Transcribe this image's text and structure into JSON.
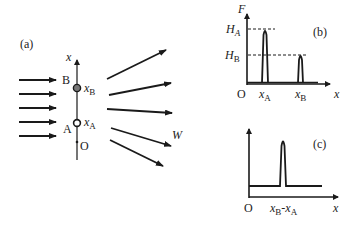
{
  "panel_a": {
    "label": "(a)",
    "axis_label": "x",
    "point_B": {
      "name": "B",
      "coord": "x",
      "sub": "B"
    },
    "point_A": {
      "name": "A",
      "coord": "x",
      "sub": "A"
    },
    "origin": "O",
    "scattered_label": "W",
    "incident_arrow_count": 5,
    "scattered_arrow_count": 5
  },
  "panel_b": {
    "label": "(b)",
    "y_axis_label": "F",
    "x_axis_label": "x",
    "origin": "O",
    "levels": [
      {
        "main": "H",
        "sub": "A"
      },
      {
        "main": "H",
        "sub": "B"
      }
    ],
    "ticks": [
      {
        "main": "x",
        "sub": "A"
      },
      {
        "main": "x",
        "sub": "B"
      }
    ]
  },
  "panel_c": {
    "label": "(c)",
    "x_axis_label": "x",
    "origin": "O",
    "tick": {
      "main1": "x",
      "sub1": "B",
      "dash": "-",
      "main2": "x",
      "sub2": "A"
    }
  },
  "colors": {
    "ink": "#1a1a1a",
    "point_B_fill": "#777777"
  }
}
